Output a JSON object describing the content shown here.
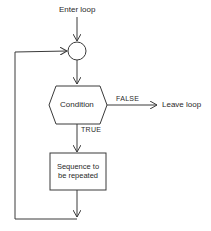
{
  "diagram": {
    "type": "flowchart",
    "title": "",
    "nodes": {
      "entry": {
        "label": "Enter loop"
      },
      "junction": {
        "shape": "circle"
      },
      "condition": {
        "label": "Condition",
        "shape": "hexagon"
      },
      "body": {
        "line1": "Sequence to",
        "line2": "be repeated",
        "shape": "rectangle"
      },
      "exit": {
        "label": "Leave loop"
      }
    },
    "edges": {
      "false_label": "FALSE",
      "true_label": "TRUE"
    },
    "colors": {
      "line": "#3a3a3a",
      "text": "#2a2a2a",
      "background": "#ffffff"
    }
  }
}
